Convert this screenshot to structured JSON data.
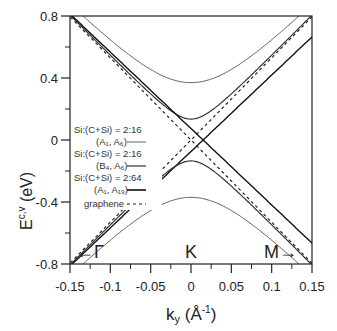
{
  "chart_data": {
    "type": "line",
    "title": "",
    "xlabel": "k_y (Å^-1)",
    "ylabel": "E^{c,v} (eV)",
    "xlim": [
      -0.15,
      0.15
    ],
    "ylim": [
      -0.8,
      0.8
    ],
    "x_ticks": [
      "-0.15",
      "-0.1",
      "-0.05",
      "0",
      "0.05",
      "0.1",
      "0.15"
    ],
    "y_ticks": [
      "0.8",
      "0.4",
      "0",
      "-0.4",
      "-0.8"
    ],
    "annotations": [
      "←Γ",
      "K",
      "M→"
    ],
    "legend_position": "left-center",
    "series": [
      {
        "name": "Si:(C+Si) = 2:16 (A1, A6)",
        "style": "solid-gray",
        "gap_eV": 0.74,
        "desc": "hyperbolic bands, minima ±0.37 eV at k=0"
      },
      {
        "name": "Si:(C+Si) = 2:16 (B4, A6)",
        "style": "solid",
        "gap_eV": 0.27,
        "desc": "hyperbolic bands, minima ±0.135 eV at k=0"
      },
      {
        "name": "Si:(C+Si) = 2:64 (A1, A19)",
        "style": "solid-bold",
        "gap_eV": 0.0,
        "desc": "linear crossing shifted to k≈0.015"
      },
      {
        "name": "graphene",
        "style": "dashed",
        "gap_eV": 0.0,
        "desc": "linear Dirac cone at k=0, slope ≈ 5.3 eV·Å"
      }
    ]
  },
  "labels": {
    "ylabel_main": "E",
    "ylabel_sup": "c,v",
    "ylabel_unit": " (eV)",
    "xlabel_k": "k",
    "xlabel_sub": "y",
    "xlabel_unit": " (Å",
    "xlabel_sup": "-1",
    "xlabel_close": ")",
    "gamma": "←Γ",
    "k_point": "K",
    "m_point": "M→"
  },
  "legend": [
    {
      "line1": "Si:(C+Si) = 2:16",
      "line2": "(A₁, A₆)"
    },
    {
      "line1": "Si:(C+Si) = 2:16",
      "line2": "(B₄, A₆)"
    },
    {
      "line1": "Si:(C+Si) = 2:64",
      "line2": "(A₁, A₁₉)"
    },
    {
      "line1": "graphene",
      "line2": ""
    }
  ]
}
